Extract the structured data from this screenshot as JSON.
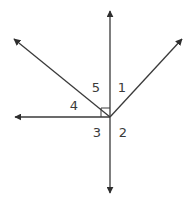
{
  "diagram": {
    "vertex": {
      "x": 110,
      "y": 117
    },
    "rays": [
      {
        "name": "up",
        "tip": {
          "x": 110,
          "y": 10
        }
      },
      {
        "name": "down",
        "tip": {
          "x": 110,
          "y": 194
        }
      },
      {
        "name": "left",
        "tip": {
          "x": 14,
          "y": 117
        }
      },
      {
        "name": "upper-left",
        "tip": {
          "x": 13,
          "y": 38
        }
      },
      {
        "name": "upper-right",
        "tip": {
          "x": 183,
          "y": 38
        }
      }
    ],
    "right_angle_marker": {
      "between": [
        "left",
        "up"
      ],
      "size": 9
    },
    "labels": [
      {
        "id": "angle-1",
        "text": "1",
        "x": 122,
        "y": 87
      },
      {
        "id": "angle-2",
        "text": "2",
        "x": 123,
        "y": 132
      },
      {
        "id": "angle-3",
        "text": "3",
        "x": 97,
        "y": 132
      },
      {
        "id": "angle-4",
        "text": "4",
        "x": 74,
        "y": 105
      },
      {
        "id": "angle-5",
        "text": "5",
        "x": 96,
        "y": 87
      }
    ],
    "colors": {
      "line": "#3a3a3a",
      "arrow": "#2e2e2e",
      "label": "#3a3a3a",
      "background": "#ffffff"
    }
  }
}
